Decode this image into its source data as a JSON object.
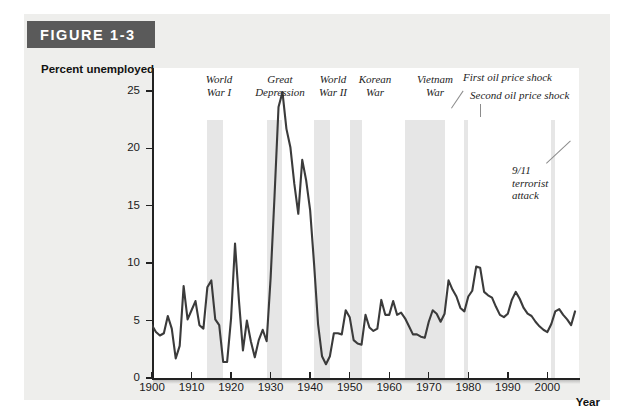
{
  "figure": {
    "plaque_label": "FIGURE 1-3"
  },
  "chart_data": {
    "type": "line",
    "title": "FIGURE 1-3",
    "xlabel": "Year",
    "ylabel": "Percent unemployed",
    "xlim": [
      1900,
      2008
    ],
    "ylim": [
      0,
      27
    ],
    "grid": false,
    "legend": "none",
    "ytick_labels": [
      "0",
      "5",
      "10",
      "15",
      "20",
      "25"
    ],
    "yticks": [
      0,
      5,
      10,
      15,
      20,
      25
    ],
    "xtick_labels": [
      "1900",
      "1910",
      "1920",
      "1930",
      "1940",
      "1950",
      "1960",
      "1970",
      "1980",
      "1990",
      "2000"
    ],
    "xticks": [
      1900,
      1910,
      1920,
      1930,
      1940,
      1950,
      1960,
      1970,
      1980,
      1990,
      2000
    ],
    "series": [
      {
        "name": "Percent unemployed",
        "color": "#3b3b3b",
        "x": [
          1900,
          1901,
          1902,
          1903,
          1904,
          1905,
          1906,
          1907,
          1908,
          1909,
          1910,
          1911,
          1912,
          1913,
          1914,
          1915,
          1916,
          1917,
          1918,
          1919,
          1920,
          1921,
          1922,
          1923,
          1924,
          1925,
          1926,
          1927,
          1928,
          1929,
          1930,
          1931,
          1932,
          1933,
          1934,
          1935,
          1936,
          1937,
          1938,
          1939,
          1940,
          1941,
          1942,
          1943,
          1944,
          1945,
          1946,
          1947,
          1948,
          1949,
          1950,
          1951,
          1952,
          1953,
          1954,
          1955,
          1956,
          1957,
          1958,
          1959,
          1960,
          1961,
          1962,
          1963,
          1964,
          1965,
          1966,
          1967,
          1968,
          1969,
          1970,
          1971,
          1972,
          1973,
          1974,
          1975,
          1976,
          1977,
          1978,
          1979,
          1980,
          1981,
          1982,
          1983,
          1984,
          1985,
          1986,
          1987,
          1988,
          1989,
          1990,
          1991,
          1992,
          1993,
          1994,
          1995,
          1996,
          1997,
          1998,
          1999,
          2000,
          2001,
          2002,
          2003,
          2004,
          2005,
          2006,
          2007
        ],
        "values": [
          4.6,
          4.0,
          3.7,
          3.9,
          5.4,
          4.3,
          1.7,
          2.8,
          8.0,
          5.1,
          5.9,
          6.7,
          4.6,
          4.3,
          7.9,
          8.5,
          5.1,
          4.6,
          1.4,
          1.4,
          5.2,
          11.7,
          6.7,
          2.4,
          5.0,
          3.2,
          1.8,
          3.3,
          4.2,
          3.2,
          8.7,
          15.9,
          23.6,
          24.9,
          21.7,
          20.1,
          16.9,
          14.3,
          19.0,
          17.2,
          14.6,
          9.9,
          4.7,
          1.9,
          1.2,
          1.9,
          3.9,
          3.9,
          3.8,
          5.9,
          5.3,
          3.3,
          3.0,
          2.9,
          5.5,
          4.4,
          4.1,
          4.3,
          6.8,
          5.5,
          5.5,
          6.7,
          5.5,
          5.7,
          5.2,
          4.5,
          3.8,
          3.8,
          3.6,
          3.5,
          4.9,
          5.9,
          5.6,
          4.9,
          5.6,
          8.5,
          7.7,
          7.1,
          6.1,
          5.8,
          7.1,
          7.6,
          9.7,
          9.6,
          7.5,
          7.2,
          7.0,
          6.2,
          5.5,
          5.3,
          5.6,
          6.8,
          7.5,
          6.9,
          6.1,
          5.6,
          5.4,
          4.9,
          4.5,
          4.2,
          4.0,
          4.7,
          5.8,
          6.0,
          5.5,
          5.1,
          4.6,
          5.8
        ]
      }
    ],
    "event_bands": [
      {
        "label": "World War I",
        "start": 1914,
        "end": 1918
      },
      {
        "label": "Great Depression",
        "start": 1929,
        "end": 1933
      },
      {
        "label": "World War II",
        "start": 1941,
        "end": 1945
      },
      {
        "label": "Korean War",
        "start": 1950,
        "end": 1953
      },
      {
        "label": "Vietnam War",
        "start": 1964,
        "end": 1973
      },
      {
        "label": "First oil price shock",
        "start": 1973,
        "end": 1974
      },
      {
        "label": "Second oil price shock",
        "start": 1979,
        "end": 1980
      },
      {
        "label": "9/11 terrorist attack",
        "start": 2001,
        "end": 2002
      }
    ],
    "annotations": [
      {
        "id": "world-war-i",
        "lines": [
          "World",
          "War I"
        ]
      },
      {
        "id": "great-depression",
        "lines": [
          "Great",
          "Depression"
        ]
      },
      {
        "id": "world-war-ii",
        "lines": [
          "World",
          "War II"
        ]
      },
      {
        "id": "korean-war",
        "lines": [
          "Korean",
          "War"
        ]
      },
      {
        "id": "vietnam-war",
        "lines": [
          "Vietnam",
          "War"
        ]
      },
      {
        "id": "first-oil-price-shock",
        "lines": [
          "First oil price shock"
        ]
      },
      {
        "id": "second-oil-price-shock",
        "lines": [
          "Second oil price shock"
        ]
      },
      {
        "id": "september-11",
        "lines": [
          "9/11",
          "terrorist",
          "attack"
        ]
      }
    ],
    "colors": {
      "line": "#3b3b3b",
      "band": "#e6e6e6",
      "axis": "#222222",
      "plaque": "#5a5a5a",
      "page": "#eeeeec"
    }
  },
  "annotation_text": {
    "ww1_l1": "World",
    "ww1_l2": "War I",
    "gd_l1": "Great",
    "gd_l2": "Depression",
    "ww2_l1": "World",
    "ww2_l2": "War II",
    "korea_l1": "Korean",
    "korea_l2": "War",
    "vietnam_l1": "Vietnam",
    "vietnam_l2": "War",
    "oil1": "First oil price shock",
    "oil2": "Second oil price shock",
    "sept11_l1": "9/11",
    "sept11_l2": "terrorist",
    "sept11_l3": "attack"
  },
  "axes": {
    "y_title": "Percent unemployed",
    "x_title": "Year"
  }
}
